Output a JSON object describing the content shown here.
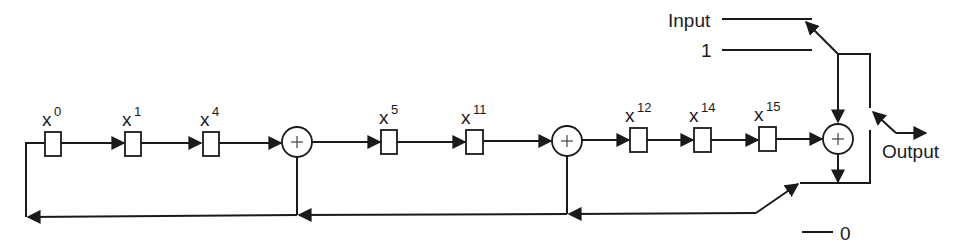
{
  "diagram": {
    "type": "LFSR / CRC-16 shift register circuit",
    "registers": [
      {
        "base": "x",
        "exp": "0"
      },
      {
        "base": "x",
        "exp": "1"
      },
      {
        "base": "x",
        "exp": "4"
      },
      {
        "base": "x",
        "exp": "5"
      },
      {
        "base": "x",
        "exp": "11"
      },
      {
        "base": "x",
        "exp": "12"
      },
      {
        "base": "x",
        "exp": "14"
      },
      {
        "base": "x",
        "exp": "15"
      }
    ],
    "adders": [
      {
        "symbol": "+"
      },
      {
        "symbol": "+"
      },
      {
        "symbol": "+"
      }
    ],
    "labels": {
      "input": "Input",
      "one": "1",
      "output": "Output",
      "zero": "0"
    },
    "colors": {
      "line": "#1a1a1a",
      "background": "#ffffff"
    }
  }
}
